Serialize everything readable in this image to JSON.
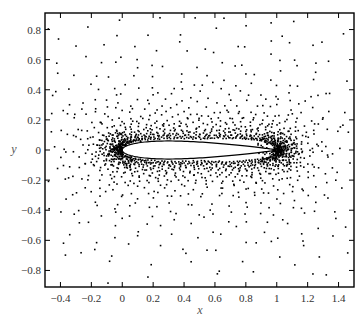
{
  "chart_data": {
    "type": "scatter",
    "title": "",
    "xlabel": "x",
    "ylabel": "y",
    "xlim": [
      -0.5,
      1.5
    ],
    "ylim": [
      -0.91,
      0.91
    ],
    "grid": false,
    "legend": null,
    "x_ticks": [
      -0.4,
      -0.2,
      0,
      0.2,
      0.4,
      0.6,
      0.8,
      1,
      1.2,
      1.4
    ],
    "x_tick_labels": [
      "-0.4",
      "-0.2",
      "0",
      "0.2",
      "0.4",
      "0.6",
      "0.8",
      "1",
      "1.2",
      "1.4"
    ],
    "y_ticks": [
      0.8,
      0.6,
      0.4,
      0.2,
      0,
      -0.2,
      -0.4,
      -0.6,
      -0.8
    ],
    "y_tick_labels": [
      "0.8",
      "0.6",
      "0.4",
      "0.2",
      "0",
      "-0.2",
      "-0.4",
      "-0.6",
      "-0.8"
    ],
    "series": [
      {
        "name": "mesh nodes",
        "marker": "square-dot",
        "color": "#000000",
        "description": "Point cloud clustered around a symmetric airfoil, densest near leading edge (0,0) and trailing edge (1,0), sparse toward domain boundaries",
        "generator": {
          "rings": 34,
          "inner_offset": 0.012,
          "growth": 1.085,
          "points_per_ring": 150,
          "jitter": 0.35
        }
      },
      {
        "name": "airfoil",
        "shape": "NACA0012",
        "chord": [
          0,
          1
        ],
        "max_thickness": 0.12,
        "fill": "#ffffff",
        "stroke": "#000000"
      }
    ]
  },
  "plot_area": {
    "left_px": 45,
    "top_px": 13,
    "right_px": 354,
    "bottom_px": 287
  }
}
